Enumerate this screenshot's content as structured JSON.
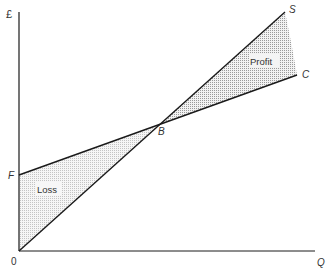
{
  "diagram": {
    "type": "break-even",
    "axes": {
      "y_label": "£",
      "x_label": "Q",
      "origin_label": "0"
    },
    "points": {
      "F": "F",
      "B": "B",
      "S": "S",
      "C": "C"
    },
    "regions": {
      "profit": "Profit",
      "loss": "Loss"
    },
    "colors": {
      "line": "#1a1a1a",
      "shade": "#cfcfcf",
      "text": "#333333"
    }
  }
}
